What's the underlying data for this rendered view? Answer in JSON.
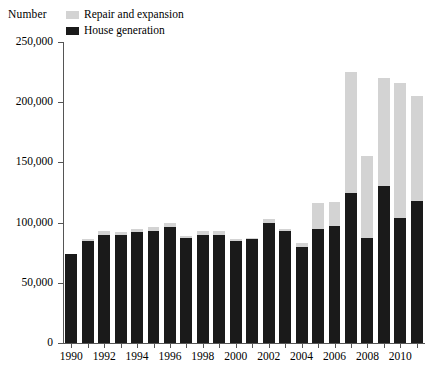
{
  "chart_data": {
    "type": "bar",
    "stacked": true,
    "title": "",
    "subtitle": "",
    "xlabel": "",
    "ylabel": "Number",
    "ylim": [
      0,
      250000
    ],
    "ytick_labels": [
      "0",
      "50,000",
      "100,000",
      "150,000",
      "200,000",
      "250,000"
    ],
    "ytick_values": [
      0,
      50000,
      100000,
      150000,
      200000,
      250000
    ],
    "grid": false,
    "legend_position": "top",
    "categories": [
      "1990",
      "1991",
      "1992",
      "1993",
      "1994",
      "1995",
      "1996",
      "1997",
      "1998",
      "1999",
      "2000",
      "2001",
      "2002",
      "2003",
      "2004",
      "2005",
      "2006",
      "2007",
      "2008",
      "2009",
      "2010",
      "2011"
    ],
    "xtick_labels_shown": [
      "1990",
      "1992",
      "1994",
      "1996",
      "1998",
      "2000",
      "2002",
      "2004",
      "2006",
      "2008",
      "2010"
    ],
    "series": [
      {
        "name": "House generation",
        "color": "#1a1a1a",
        "values": [
          74000,
          85000,
          90000,
          90000,
          92000,
          93000,
          96000,
          87000,
          90000,
          90000,
          85000,
          86000,
          100000,
          93000,
          80000,
          95000,
          97000,
          125000,
          87000,
          130000,
          104000,
          118000
        ]
      },
      {
        "name": "Repair and expansion",
        "color": "#d3d3d3",
        "values": [
          0,
          1000,
          3000,
          2000,
          3000,
          3000,
          4000,
          2000,
          3000,
          3000,
          1000,
          1000,
          3000,
          2000,
          3000,
          21000,
          20000,
          100000,
          68000,
          90000,
          112000,
          87000
        ]
      }
    ],
    "totals": [
      74000,
      86000,
      93000,
      92000,
      95000,
      96000,
      100000,
      89000,
      93000,
      93000,
      86000,
      87000,
      103000,
      95000,
      83000,
      116000,
      117000,
      225000,
      155000,
      220000,
      216000,
      205000
    ]
  },
  "legend": {
    "items": [
      {
        "label": "Repair and expansion",
        "swatch": "#d3d3d3"
      },
      {
        "label": "House generation",
        "swatch": "#1a1a1a"
      }
    ]
  },
  "axis": {
    "unit_label": "Number"
  }
}
